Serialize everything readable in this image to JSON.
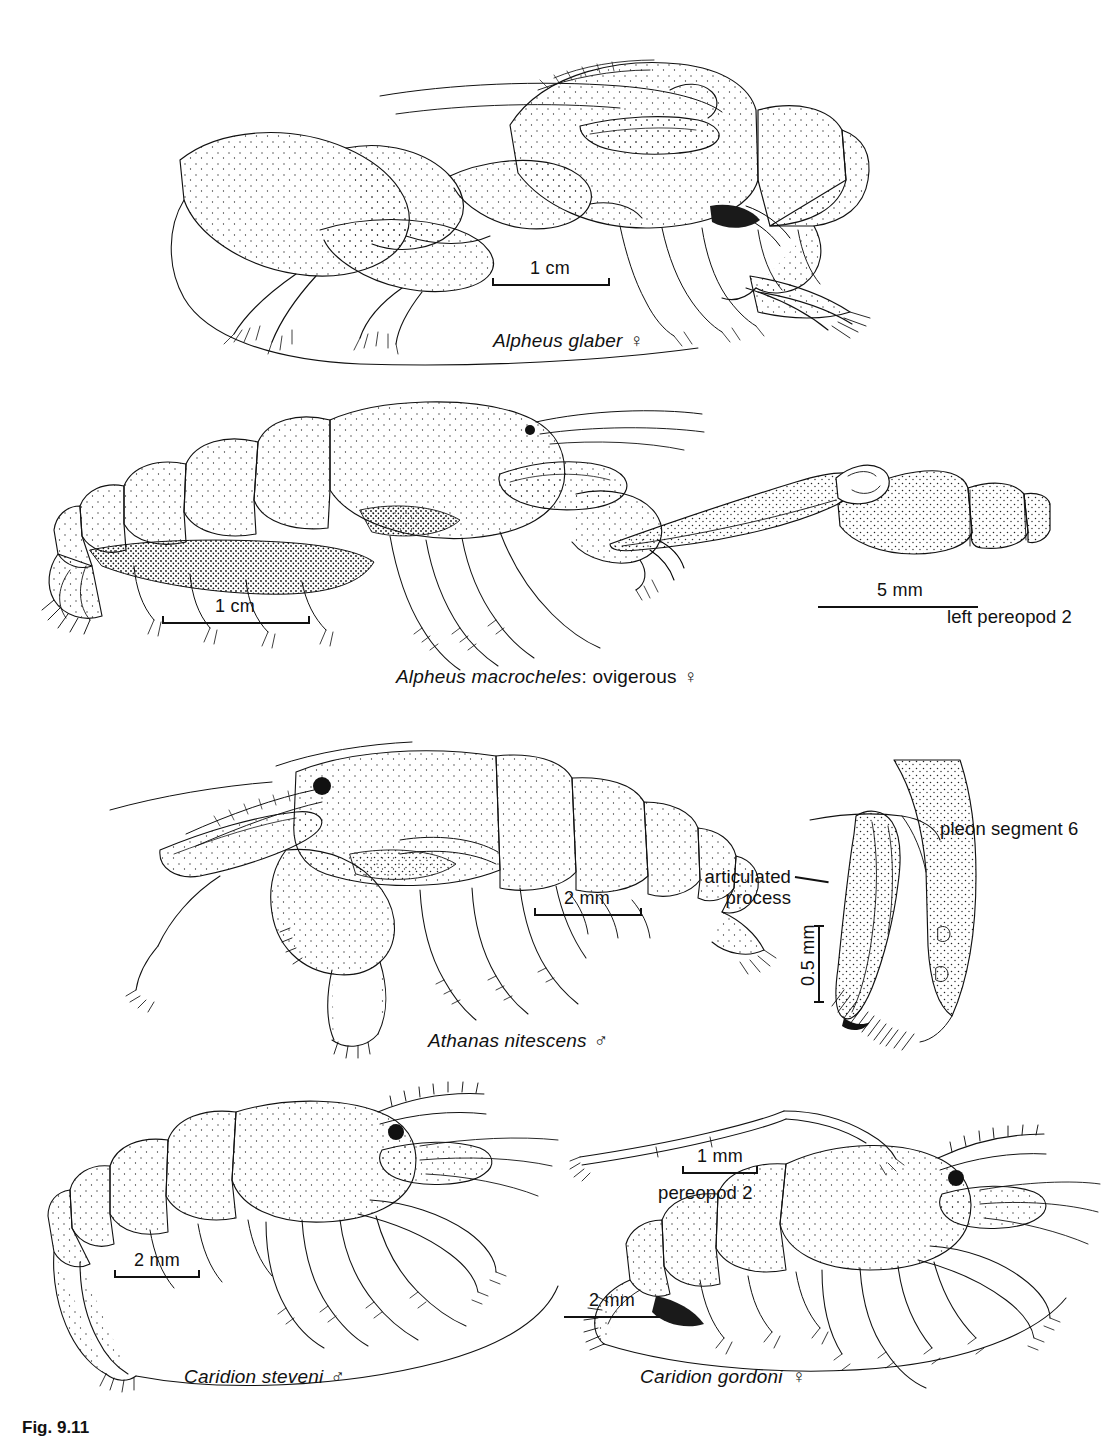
{
  "plate": {
    "caption": "Fig. 9.11",
    "background": "#ffffff",
    "ink": "#111111"
  },
  "figures": [
    {
      "id": "alpheus-glaber",
      "species_label": "Alpheus glaber",
      "sex_symbol": "♀",
      "suffix": "",
      "scale": {
        "value": "1 cm",
        "style": "ticks"
      }
    },
    {
      "id": "alpheus-macrocheles",
      "species_label": "Alpheus macrocheles",
      "sex_symbol": "♀",
      "suffix": ": ovigerous",
      "scale": {
        "value": "1 cm",
        "style": "ticks"
      }
    },
    {
      "id": "alpheus-macrocheles-pereopod",
      "part_label": "left pereopod 2",
      "scale": {
        "value": "5 mm",
        "style": "plain"
      }
    },
    {
      "id": "athanas-nitescens",
      "species_label": "Athanas nitescens",
      "sex_symbol": "♂",
      "suffix": "",
      "scale": {
        "value": "2 mm",
        "style": "ticks"
      }
    },
    {
      "id": "athanas-nitescens-pleon",
      "callouts": [
        {
          "name": "pleon-segment-6",
          "text": "pleon segment 6"
        },
        {
          "name": "articulated-process",
          "line1": "articulated",
          "line2": "process"
        }
      ],
      "scale": {
        "value": "0.5 mm",
        "style": "vertical"
      }
    },
    {
      "id": "caridion-steveni",
      "species_label": "Caridion steveni",
      "sex_symbol": "♂",
      "suffix": "",
      "scale": {
        "value": "2 mm",
        "style": "ticks"
      }
    },
    {
      "id": "caridion-gordoni",
      "species_label": "Caridion gordoni",
      "sex_symbol": "♀",
      "suffix": "",
      "scale": {
        "value": "2 mm",
        "style": "plain"
      }
    },
    {
      "id": "caridion-pereopod",
      "part_label": "pereopod 2",
      "scale": {
        "value": "1 mm",
        "style": "ticks"
      }
    }
  ]
}
